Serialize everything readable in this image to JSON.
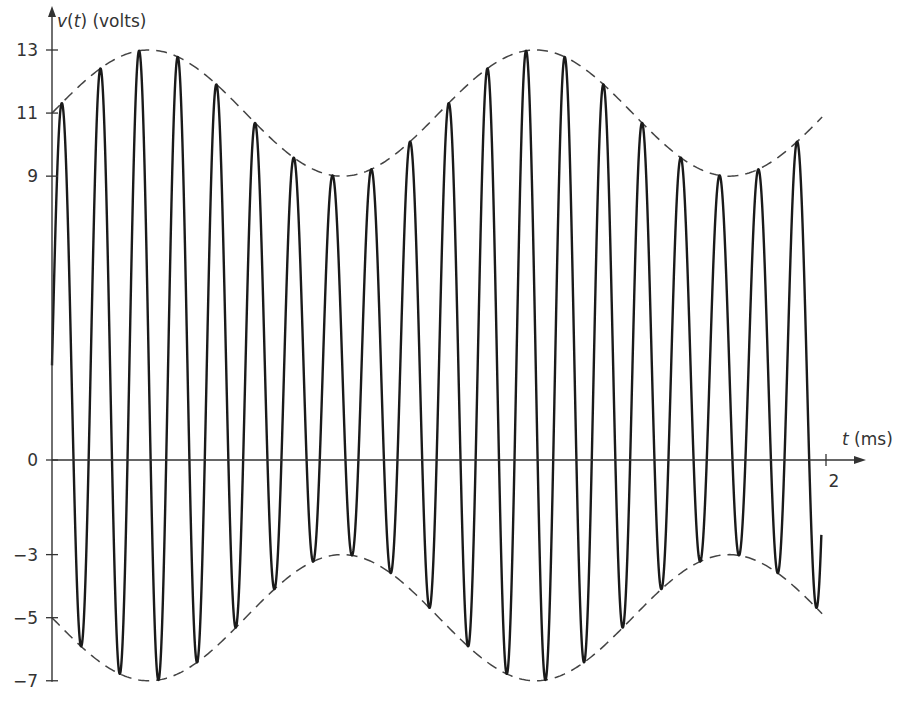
{
  "chart_data": {
    "type": "line",
    "title": "",
    "xlabel": {
      "var": "t",
      "unit": " (ms)"
    },
    "ylabel": {
      "var": "v",
      "arg": "t",
      "unit": " (volts)"
    },
    "xlim": [
      0,
      2
    ],
    "ylim": [
      -7,
      13
    ],
    "x_ticks": [
      {
        "value": 2,
        "label": "2"
      }
    ],
    "y_ticks": [
      {
        "value": 13,
        "label": "13"
      },
      {
        "value": 11,
        "label": "11"
      },
      {
        "value": 9,
        "label": "9"
      },
      {
        "value": 0,
        "label": "0"
      },
      {
        "value": -3,
        "label": "−3"
      },
      {
        "value": -5,
        "label": "−5"
      },
      {
        "value": -7,
        "label": "−7"
      }
    ],
    "grid": false,
    "legend": "none",
    "series": [
      {
        "name": "v(t)",
        "style": "solid",
        "color": "#1a1a1a",
        "description": "AM signal: v(t) = 3 + (8 + 2 sin(2π·1 kHz·t)) sin(2π·10 kHz·t)",
        "dc_offset": 3,
        "carrier_amplitude": 8,
        "modulation_amplitude": 2,
        "carrier_freq_khz": 10,
        "modulation_freq_khz": 1,
        "t_range": [
          0,
          2
        ]
      },
      {
        "name": "upper envelope",
        "style": "dashed",
        "color": "#444444",
        "description": "3 + 8 + 2 sin(2π·1 kHz·t)",
        "t_range": [
          0,
          2
        ]
      },
      {
        "name": "lower envelope",
        "style": "dashed",
        "color": "#444444",
        "description": "3 − 8 − 2 sin(2π·1 kHz·t)",
        "t_range": [
          0,
          2
        ]
      }
    ]
  }
}
